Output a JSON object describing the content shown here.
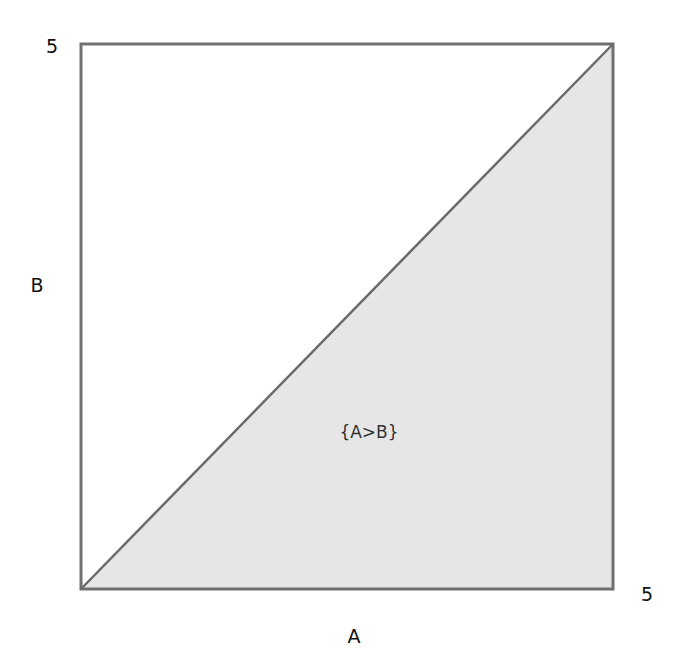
{
  "diagram": {
    "x_axis_label": "A",
    "y_axis_label": "B",
    "x_max_label": "5",
    "y_max_label": "5",
    "region_label": "{A>B}",
    "colors": {
      "border": "#707070",
      "region_fill": "#e6e6e6",
      "background": "#ffffff"
    },
    "domain": {
      "x": [
        0,
        5
      ],
      "y": [
        0,
        5
      ]
    },
    "diagonal": "A = B",
    "shaded_region": "A > B (below diagonal)"
  }
}
